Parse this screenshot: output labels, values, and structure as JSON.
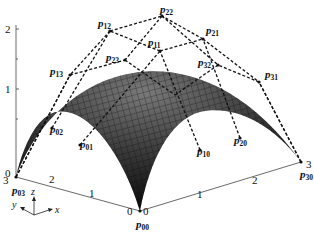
{
  "figure": {
    "type": "bezier-surface-3d",
    "control_points": [
      {
        "id": "p00",
        "label": "p",
        "sub": "00",
        "x": 140,
        "y": 211,
        "lx": 136,
        "ly": 228
      },
      {
        "id": "p01",
        "label": "p",
        "sub": "01",
        "x": 80,
        "y": 145,
        "lx": 80,
        "ly": 148
      },
      {
        "id": "p02",
        "label": "p",
        "sub": "02",
        "x": 52,
        "y": 128,
        "lx": 50,
        "ly": 133
      },
      {
        "id": "p03",
        "label": "p",
        "sub": "03",
        "x": 16,
        "y": 177,
        "lx": 12,
        "ly": 194
      },
      {
        "id": "p10",
        "label": "p",
        "sub": "10",
        "x": 200,
        "y": 150,
        "lx": 197,
        "ly": 155
      },
      {
        "id": "p11",
        "label": "p",
        "sub": "11",
        "x": 160,
        "y": 51,
        "lx": 148,
        "ly": 46
      },
      {
        "id": "p12",
        "label": "p",
        "sub": "12",
        "x": 110,
        "y": 31,
        "lx": 98,
        "ly": 27
      },
      {
        "id": "p13",
        "label": "p",
        "sub": "13",
        "x": 70,
        "y": 75,
        "lx": 50,
        "ly": 75
      },
      {
        "id": "p20",
        "label": "p",
        "sub": "20",
        "x": 240,
        "y": 138,
        "lx": 234,
        "ly": 144
      },
      {
        "id": "p21",
        "label": "p",
        "sub": "21",
        "x": 203,
        "y": 39,
        "lx": 206,
        "ly": 34
      },
      {
        "id": "p22",
        "label": "p",
        "sub": "22",
        "x": 162,
        "y": 16,
        "lx": 160,
        "ly": 13
      },
      {
        "id": "p23",
        "label": "p",
        "sub": "23",
        "x": 125,
        "y": 60,
        "lx": 106,
        "ly": 61
      },
      {
        "id": "p30",
        "label": "p",
        "sub": "30",
        "x": 301,
        "y": 162,
        "lx": 300,
        "ly": 178
      },
      {
        "id": "p31",
        "label": "p",
        "sub": "31",
        "x": 259,
        "y": 82,
        "lx": 265,
        "ly": 78
      },
      {
        "id": "p32",
        "label": "p",
        "sub": "32",
        "x": 218,
        "y": 65,
        "lx": 198,
        "ly": 66
      },
      {
        "id": "p33",
        "label": "",
        "sub": "",
        "x": 175,
        "y": 95,
        "lx": 0,
        "ly": 0
      }
    ],
    "z_axis": {
      "ticks": [
        {
          "label": "0",
          "y": 173
        },
        {
          "label": "1",
          "y": 89
        },
        {
          "label": "2",
          "y": 29
        }
      ],
      "x": 16
    },
    "y_axis_ticks": [
      {
        "label": "3",
        "x": 3,
        "y": 184
      },
      {
        "label": "2",
        "x": 49,
        "y": 183
      },
      {
        "label": "1",
        "x": 89,
        "y": 197
      },
      {
        "label": "0",
        "x": 127,
        "y": 215
      }
    ],
    "x_axis_ticks": [
      {
        "label": "0",
        "x": 143,
        "y": 215
      },
      {
        "label": "1",
        "x": 197,
        "y": 198
      },
      {
        "label": "2",
        "x": 252,
        "y": 184
      },
      {
        "label": "3",
        "x": 306,
        "y": 168
      }
    ],
    "axis_legend": {
      "z": "z",
      "y": "y",
      "x": "x"
    }
  }
}
